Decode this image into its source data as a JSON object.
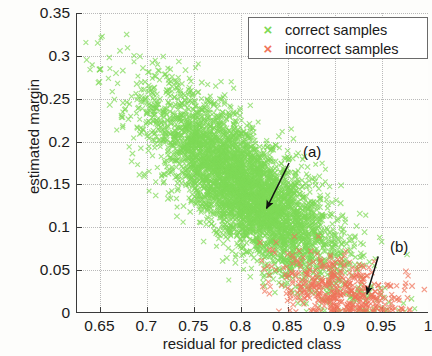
{
  "chart_data": {
    "type": "scatter",
    "title": "",
    "xlabel": "residual for predicted class",
    "ylabel": "estimated margin",
    "xlim": [
      0.625,
      1.0
    ],
    "ylim": [
      0,
      0.35
    ],
    "xticks": [
      "0.65",
      "0.7",
      "0.75",
      "0.8",
      "0.85",
      "0.9",
      "0.95",
      "1"
    ],
    "xtick_values": [
      0.65,
      0.7,
      0.75,
      0.8,
      0.85,
      0.9,
      0.95,
      1.0
    ],
    "yticks": [
      "0",
      "0.05",
      "0.1",
      "0.15",
      "0.2",
      "0.25",
      "0.3",
      "0.35"
    ],
    "ytick_values": [
      0,
      0.05,
      0.1,
      0.15,
      0.2,
      0.25,
      0.3,
      0.35
    ],
    "grid": true,
    "marker": "x",
    "legend_position": "top-right",
    "series": [
      {
        "name": "correct samples",
        "color": "#7ed957",
        "marker": "x",
        "count": 4200,
        "description": "Dense elongated negatively-correlated cloud running from (0.66,0.30) down to (0.97,0.00); bulk of mass between residual 0.72-0.92 and margin 0.03-0.26",
        "cloud": {
          "x_center": 0.805,
          "y_center": 0.145,
          "x_spread": 0.052,
          "y_spread": 0.055,
          "correlation": -0.78
        }
      },
      {
        "name": "incorrect samples",
        "color": "#f0735a",
        "marker": "x",
        "count": 430,
        "description": "Sparse cluster concentrated at high residual and near-zero margin; residual 0.82-0.99, margin 0.00-0.09",
        "cloud": {
          "x_center": 0.905,
          "y_center": 0.025,
          "x_spread": 0.035,
          "y_spread": 0.021,
          "correlation": -0.35
        }
      }
    ],
    "annotations": [
      {
        "label": "(a)",
        "text_x": 0.855,
        "text_y": 0.188,
        "arrow_from": [
          0.852,
          0.175
        ],
        "arrow_to": [
          0.828,
          0.122
        ],
        "note": "arrow points to an isolated incorrect sample inside the correct-sample cloud"
      },
      {
        "label": "(b)",
        "text_x": 0.95,
        "text_y": 0.078,
        "arrow_from": [
          0.947,
          0.066
        ],
        "arrow_to": [
          0.935,
          0.022
        ],
        "note": "arrow points to correct samples at the extreme right edge"
      }
    ]
  },
  "legend": {
    "items": [
      {
        "label": "correct samples",
        "marker": "×",
        "color": "#7ed957"
      },
      {
        "label": "incorrect samples",
        "marker": "×",
        "color": "#f0735a"
      }
    ]
  },
  "annotations": {
    "a_label": "(a)",
    "b_label": "(b)"
  }
}
